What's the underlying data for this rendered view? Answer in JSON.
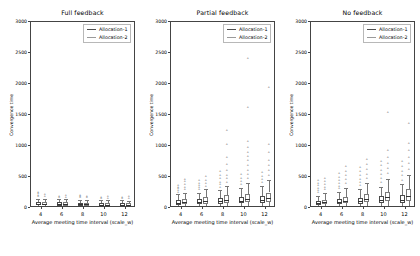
{
  "figure": {
    "ylabel": "Convergence time",
    "xlabel": "Average meeting time interval (scale_w)",
    "ytick_labels": [
      "0",
      "500",
      "1000",
      "1500",
      "2000",
      "2500",
      "3000"
    ],
    "xtick_labels": [
      "4",
      "6",
      "8",
      "10",
      "12"
    ],
    "legend": {
      "series1": "Allocation-1",
      "series2": "Allocation-2",
      "color1": "#4d4d4d",
      "color2": "#9a9a9a"
    }
  },
  "chart_data": {
    "type": "box",
    "xlabel": "Average meeting time interval (scale_w)",
    "ylabel": "Convergence time",
    "ylim": [
      0,
      3000
    ],
    "yticks": [
      0,
      500,
      1000,
      1500,
      2000,
      2500,
      3000
    ],
    "xticks": [
      4,
      6,
      8,
      10,
      12
    ],
    "grid": false,
    "legend_position": "upper right",
    "legend_entries": [
      "Allocation-1",
      "Allocation-2"
    ],
    "panels": [
      {
        "title": "Full feedback",
        "categories": [
          4,
          6,
          8,
          10,
          12
        ],
        "series": [
          {
            "name": "Allocation-1",
            "boxes": [
              {
                "x": 4,
                "q1": 45,
                "median": 70,
                "q3": 100,
                "whisker_low": 20,
                "whisker_high": 150,
                "fliers": [
                  180,
                  200,
                  225,
                  245
                ]
              },
              {
                "x": 6,
                "q1": 40,
                "median": 62,
                "q3": 92,
                "whisker_low": 18,
                "whisker_high": 140,
                "fliers": [
                  165,
                  185
                ]
              },
              {
                "x": 8,
                "q1": 38,
                "median": 60,
                "q3": 88,
                "whisker_low": 16,
                "whisker_high": 135,
                "fliers": [
                  160,
                  178,
                  195
                ]
              },
              {
                "x": 10,
                "q1": 36,
                "median": 56,
                "q3": 84,
                "whisker_low": 15,
                "whisker_high": 128,
                "fliers": [
                  150,
                  168
                ]
              },
              {
                "x": 12,
                "q1": 34,
                "median": 54,
                "q3": 80,
                "whisker_low": 14,
                "whisker_high": 122,
                "fliers": [
                  145,
                  162
                ]
              }
            ]
          },
          {
            "name": "Allocation-2",
            "boxes": [
              {
                "x": 4,
                "q1": 42,
                "median": 66,
                "q3": 96,
                "whisker_low": 19,
                "whisker_high": 145,
                "fliers": [
                  175,
                  205
                ]
              },
              {
                "x": 6,
                "q1": 40,
                "median": 62,
                "q3": 90,
                "whisker_low": 17,
                "whisker_high": 138,
                "fliers": [
                  168,
                  190
                ]
              },
              {
                "x": 8,
                "q1": 38,
                "median": 58,
                "q3": 86,
                "whisker_low": 16,
                "whisker_high": 130,
                "fliers": [
                  158,
                  182
                ]
              },
              {
                "x": 10,
                "q1": 36,
                "median": 55,
                "q3": 82,
                "whisker_low": 15,
                "whisker_high": 125,
                "fliers": [
                  150,
                  172
                ]
              },
              {
                "x": 12,
                "q1": 35,
                "median": 54,
                "q3": 80,
                "whisker_low": 14,
                "whisker_high": 120,
                "fliers": [
                  148,
                  170
                ]
              }
            ]
          }
        ]
      },
      {
        "title": "Partial feedback",
        "categories": [
          4,
          6,
          8,
          10,
          12
        ],
        "series": [
          {
            "name": "Allocation-1",
            "boxes": [
              {
                "x": 4,
                "q1": 55,
                "median": 85,
                "q3": 125,
                "whisker_low": 22,
                "whisker_high": 220,
                "fliers": [
                  250,
                  275,
                  300,
                  330,
                  360
                ]
              },
              {
                "x": 6,
                "q1": 60,
                "median": 95,
                "q3": 140,
                "whisker_low": 24,
                "whisker_high": 250,
                "fliers": [
                  285,
                  320,
                  355,
                  395,
                  430
                ]
              },
              {
                "x": 8,
                "q1": 68,
                "median": 105,
                "q3": 158,
                "whisker_low": 26,
                "whisker_high": 290,
                "fliers": [
                  330,
                  370,
                  410,
                  460,
                  520,
                  575
                ]
              },
              {
                "x": 10,
                "q1": 75,
                "median": 118,
                "q3": 175,
                "whisker_low": 28,
                "whisker_high": 320,
                "fliers": [
                  370,
                  420,
                  470,
                  530
                ]
              },
              {
                "x": 12,
                "q1": 80,
                "median": 125,
                "q3": 190,
                "whisker_low": 30,
                "whisker_high": 350,
                "fliers": [
                  400,
                  450,
                  505,
                  560
                ]
              }
            ]
          },
          {
            "name": "Allocation-2",
            "boxes": [
              {
                "x": 4,
                "q1": 60,
                "median": 95,
                "q3": 140,
                "whisker_low": 24,
                "whisker_high": 250,
                "fliers": [
                  290,
                  330,
                  370,
                  415,
                  455
                ]
              },
              {
                "x": 6,
                "q1": 70,
                "median": 115,
                "q3": 170,
                "whisker_low": 27,
                "whisker_high": 300,
                "fliers": [
                  345,
                  390,
                  440,
                  495
                ]
              },
              {
                "x": 8,
                "q1": 85,
                "median": 135,
                "q3": 205,
                "whisker_low": 30,
                "whisker_high": 360,
                "fliers": [
                  410,
                  465,
                  520,
                  600,
                  700,
                  810,
                  1010,
                  1240
                ]
              },
              {
                "x": 10,
                "q1": 95,
                "median": 150,
                "q3": 230,
                "whisker_low": 32,
                "whisker_high": 410,
                "fliers": [
                  470,
                  530,
                  600,
                  680,
                  760,
                  820,
                  880,
                  960,
                  1070,
                  1610,
                  2410
                ]
              },
              {
                "x": 12,
                "q1": 100,
                "median": 160,
                "q3": 250,
                "whisker_low": 34,
                "whisker_high": 450,
                "fliers": [
                  520,
                  590,
                  670,
                  760,
                  880,
                  1010,
                  1940
                ]
              }
            ]
          }
        ]
      },
      {
        "title": "No feedback",
        "categories": [
          4,
          6,
          8,
          10,
          12
        ],
        "series": [
          {
            "name": "Allocation-1",
            "boxes": [
              {
                "x": 4,
                "q1": 50,
                "median": 78,
                "q3": 115,
                "whisker_low": 22,
                "whisker_high": 200,
                "fliers": [
                  240,
                  275,
                  310,
                  350,
                  390,
                  430
                ]
              },
              {
                "x": 6,
                "q1": 60,
                "median": 95,
                "q3": 142,
                "whisker_low": 25,
                "whisker_high": 255,
                "fliers": [
                  300,
                  345,
                  390,
                  440,
                  490,
                  545
                ]
              },
              {
                "x": 8,
                "q1": 70,
                "median": 110,
                "q3": 165,
                "whisker_low": 28,
                "whisker_high": 300,
                "fliers": [
                  350,
                  400,
                  455,
                  515,
                  580,
                  650
                ]
              },
              {
                "x": 10,
                "q1": 78,
                "median": 125,
                "q3": 190,
                "whisker_low": 30,
                "whisker_high": 340,
                "fliers": [
                  400,
                  460,
                  525,
                  595,
                  670,
                  750
                ]
              },
              {
                "x": 12,
                "q1": 85,
                "median": 135,
                "q3": 210,
                "whisker_low": 32,
                "whisker_high": 380,
                "fliers": [
                  440,
                  510,
                  580,
                  660,
                  750
                ]
              }
            ]
          },
          {
            "name": "Allocation-2",
            "boxes": [
              {
                "x": 4,
                "q1": 58,
                "median": 90,
                "q3": 135,
                "whisker_low": 24,
                "whisker_high": 240,
                "fliers": [
                  285,
                  330,
                  375,
                  425,
                  470
                ]
              },
              {
                "x": 6,
                "q1": 75,
                "median": 120,
                "q3": 185,
                "whisker_low": 28,
                "whisker_high": 330,
                "fliers": [
                  390,
                  450,
                  515,
                  585,
                  660
                ]
              },
              {
                "x": 8,
                "q1": 90,
                "median": 145,
                "q3": 225,
                "whisker_low": 32,
                "whisker_high": 400,
                "fliers": [
                  465,
                  535,
                  610,
                  690,
                  780
                ]
              },
              {
                "x": 10,
                "q1": 105,
                "median": 170,
                "q3": 265,
                "whisker_low": 35,
                "whisker_high": 470,
                "fliers": [
                  545,
                  625,
                  715,
                  810,
                  920,
                  1530
                ]
              },
              {
                "x": 12,
                "q1": 120,
                "median": 195,
                "q3": 300,
                "whisker_low": 38,
                "whisker_high": 540,
                "fliers": [
                  620,
                  710,
                  810,
                  920,
                  1040,
                  1360
                ]
              }
            ]
          }
        ]
      }
    ]
  }
}
